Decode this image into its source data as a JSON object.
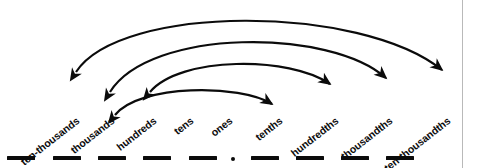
{
  "diagram": {
    "type": "place-value-arc-diagram",
    "stroke_color": "#0b0b0b",
    "background_color": "#ffffff",
    "border_color": "#b9b9b9",
    "label_rotation_deg": -38,
    "labels": [
      {
        "text": "ten-thousands",
        "anchor_x": 78,
        "anchor_y": 120,
        "side": "whole"
      },
      {
        "text": "thousands",
        "anchor_x": 113,
        "anchor_y": 120,
        "side": "whole"
      },
      {
        "text": "hundreds",
        "anchor_x": 155,
        "anchor_y": 120,
        "side": "whole"
      },
      {
        "text": "tens",
        "anchor_x": 192,
        "anchor_y": 120,
        "side": "whole"
      },
      {
        "text": "ones",
        "anchor_x": 231,
        "anchor_y": 120,
        "side": "whole"
      },
      {
        "text": "tenths",
        "anchor_x": 281,
        "anchor_y": 120,
        "side": "decimal"
      },
      {
        "text": "hundredths",
        "anchor_x": 337,
        "anchor_y": 120,
        "side": "decimal"
      },
      {
        "text": "thousandths",
        "anchor_x": 391,
        "anchor_y": 120,
        "side": "decimal"
      },
      {
        "text": "ten-thousandths",
        "anchor_x": 449,
        "anchor_y": 120,
        "side": "decimal"
      }
    ],
    "dashes": [
      {
        "name": "blank-ten-thousands",
        "x": 7,
        "y": 156
      },
      {
        "name": "blank-thousands",
        "x": 53,
        "y": 156
      },
      {
        "name": "blank-hundreds",
        "x": 98,
        "y": 156
      },
      {
        "name": "blank-tens",
        "x": 143,
        "y": 156
      },
      {
        "name": "blank-ones",
        "x": 189,
        "y": 156
      },
      {
        "name": "blank-tenths",
        "x": 251,
        "y": 156
      },
      {
        "name": "blank-hundredths",
        "x": 296,
        "y": 156
      },
      {
        "name": "blank-thousandths",
        "x": 341,
        "y": 156
      },
      {
        "name": "blank-ten-thousandths",
        "x": 386,
        "y": 156
      }
    ],
    "decimal_point": {
      "x": 231,
      "y": 157
    },
    "arcs": [
      {
        "name": "arc-ones-to-tenths",
        "pairs": [
          "tens",
          "tenths"
        ],
        "path": "M 115 115 C 140 84, 240 84, 272 104",
        "apex_y": 95
      },
      {
        "name": "arc-hundreds-to-hundredths",
        "pairs": [
          "hundreds",
          "hundredths"
        ],
        "path": "M 150 92 C 180 56, 290 56, 330 84",
        "apex_y": 67
      },
      {
        "name": "arc-thousands-to-thousandths",
        "pairs": [
          "thousands",
          "thousandths"
        ],
        "path": "M 110 92 C 150 28, 330 28, 386 78",
        "apex_y": 40
      },
      {
        "name": "arc-ten-thousands-to-ten-thousandths",
        "pairs": [
          "ten-thousands",
          "ten-thousandths"
        ],
        "path": "M 76 72 C 120 4, 360 4, 442 70",
        "apex_y": 12
      }
    ],
    "right_rule_x": 462
  }
}
